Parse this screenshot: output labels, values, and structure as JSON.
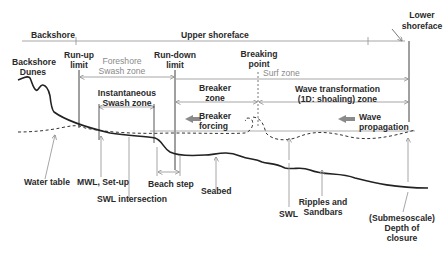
{
  "diagram": {
    "colors": {
      "line": "#2b2b2b",
      "guide": "#8f8f8f",
      "arrow_fill": "#8a8a8a",
      "gray_text": "#8a8a8a"
    },
    "top_labels": {
      "backshore": "Backshore",
      "upper_shoreface": "Upper shoreface",
      "lower_shoreface_1": "Lower",
      "lower_shoreface_2": "shoreface"
    },
    "limits": {
      "runup_1": "Run-up",
      "runup_2": "limit",
      "rundown_1": "Run-down",
      "rundown_2": "limit",
      "breaking_1": "Breaking",
      "breaking_2": "point"
    },
    "zones": {
      "backshore_dunes_1": "Backshore",
      "backshore_dunes_2": "Dunes",
      "foreshore_1": "Foreshore",
      "foreshore_2": "Swash zone",
      "surf_zone": "Surf zone",
      "instantaneous_1": "Instantaneous",
      "instantaneous_2": "Swash zone",
      "breaker_zone_1": "Breaker",
      "breaker_zone_2": "zone",
      "wave_transform_1": "Wave transformation",
      "wave_transform_2": "(1D: shoaling) zone"
    },
    "forcing": {
      "breaker_1": "Breaker",
      "breaker_2": "forcing",
      "wave_1": "Wave",
      "wave_2": "propagation"
    },
    "bottom_labels": {
      "water_table": "Water table",
      "mwl": "MWL, Set-up",
      "swl_intersection": "SWL intersection",
      "beach_step": "Beach step",
      "seabed": "Seabed",
      "swl": "SWL",
      "ripples_1": "Ripples and",
      "ripples_2": "Sandbars",
      "doc_1": "(Submesoscale)",
      "doc_2": "Depth of",
      "doc_3": "closure"
    }
  }
}
